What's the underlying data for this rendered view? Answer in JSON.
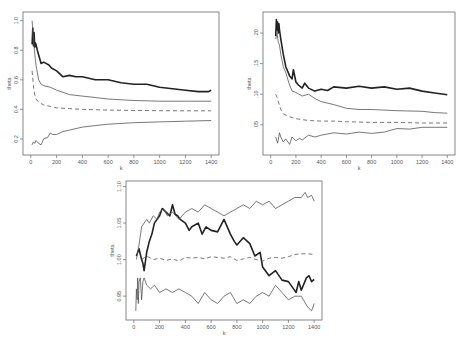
{
  "chart_data": [
    {
      "type": "line",
      "panel": "top-left",
      "title": "",
      "xlabel": "k",
      "ylabel": "theta",
      "xlim": [
        0,
        1400
      ],
      "ylim": [
        0.13,
        1.02
      ],
      "xticks": [
        0,
        200,
        400,
        600,
        800,
        1000,
        1200,
        1400
      ],
      "yticks": [
        0.2,
        0.4,
        0.6,
        0.8,
        1.0
      ],
      "ytick_labels": [
        "0.2",
        "0.4",
        "0.6",
        "0.8",
        "1.0"
      ],
      "grid": false,
      "legend": null,
      "series": [
        {
          "name": "upper",
          "style": "thick",
          "x": [
            10,
            15,
            20,
            25,
            30,
            35,
            40,
            50,
            60,
            80,
            100,
            140,
            160,
            200,
            250,
            300,
            350,
            400,
            500,
            600,
            700,
            800,
            900,
            1000,
            1100,
            1200,
            1300,
            1380,
            1400
          ],
          "y": [
            0.84,
            0.95,
            0.83,
            0.92,
            0.82,
            0.85,
            0.84,
            0.8,
            0.77,
            0.71,
            0.72,
            0.7,
            0.68,
            0.66,
            0.62,
            0.63,
            0.62,
            0.62,
            0.6,
            0.6,
            0.58,
            0.57,
            0.57,
            0.55,
            0.54,
            0.53,
            0.52,
            0.52,
            0.53
          ]
        },
        {
          "name": "middle",
          "style": "thin",
          "x": [
            10,
            20,
            30,
            40,
            60,
            80,
            100,
            150,
            200,
            300,
            400,
            500,
            600,
            800,
            1000,
            1200,
            1400
          ],
          "y": [
            1.0,
            0.88,
            0.78,
            0.7,
            0.6,
            0.57,
            0.56,
            0.55,
            0.53,
            0.5,
            0.49,
            0.48,
            0.47,
            0.46,
            0.455,
            0.455,
            0.455
          ]
        },
        {
          "name": "mean",
          "style": "dashed",
          "x": [
            10,
            20,
            30,
            40,
            60,
            80,
            100,
            150,
            200,
            300,
            400,
            600,
            800,
            1000,
            1200,
            1400
          ],
          "y": [
            0.66,
            0.56,
            0.5,
            0.47,
            0.45,
            0.44,
            0.43,
            0.42,
            0.41,
            0.405,
            0.4,
            0.395,
            0.393,
            0.391,
            0.39,
            0.39
          ]
        },
        {
          "name": "lower",
          "style": "thin",
          "x": [
            10,
            20,
            30,
            40,
            60,
            80,
            100,
            130,
            150,
            170,
            200,
            250,
            300,
            400,
            500,
            600,
            800,
            1000,
            1200,
            1400
          ],
          "y": [
            0.16,
            0.18,
            0.17,
            0.19,
            0.17,
            0.16,
            0.2,
            0.21,
            0.24,
            0.23,
            0.23,
            0.25,
            0.26,
            0.28,
            0.29,
            0.3,
            0.31,
            0.315,
            0.32,
            0.325
          ]
        }
      ]
    },
    {
      "type": "line",
      "panel": "top-right",
      "title": "",
      "xlabel": "k",
      "ylabel": "theta",
      "xlim": [
        0,
        1400
      ],
      "ylim": [
        0.01,
        0.225
      ],
      "xticks": [
        0,
        200,
        400,
        600,
        800,
        1000,
        1200,
        1400
      ],
      "yticks": [
        0.05,
        0.1,
        0.15,
        0.2
      ],
      "ytick_labels": [
        ".05",
        ".10",
        ".15",
        ".20"
      ],
      "grid": false,
      "legend": null,
      "series": [
        {
          "name": "upper",
          "style": "thick",
          "x": [
            40,
            45,
            50,
            55,
            60,
            65,
            70,
            80,
            100,
            120,
            150,
            170,
            180,
            200,
            220,
            250,
            270,
            300,
            350,
            400,
            450,
            500,
            600,
            700,
            800,
            900,
            1000,
            1100,
            1200,
            1300,
            1400
          ],
          "y": [
            0.195,
            0.222,
            0.205,
            0.218,
            0.2,
            0.215,
            0.205,
            0.19,
            0.165,
            0.145,
            0.13,
            0.125,
            0.14,
            0.12,
            0.115,
            0.11,
            0.118,
            0.11,
            0.105,
            0.108,
            0.106,
            0.112,
            0.11,
            0.113,
            0.11,
            0.112,
            0.108,
            0.11,
            0.105,
            0.102,
            0.099
          ]
        },
        {
          "name": "middle",
          "style": "thin",
          "x": [
            40,
            50,
            60,
            70,
            80,
            100,
            120,
            150,
            170,
            200,
            250,
            300,
            350,
            400,
            500,
            600,
            700,
            800,
            1000,
            1200,
            1300,
            1400
          ],
          "y": [
            0.19,
            0.2,
            0.185,
            0.18,
            0.165,
            0.145,
            0.135,
            0.115,
            0.105,
            0.103,
            0.097,
            0.1,
            0.093,
            0.088,
            0.083,
            0.077,
            0.075,
            0.075,
            0.073,
            0.072,
            0.07,
            0.069
          ]
        },
        {
          "name": "mean",
          "style": "dashed",
          "x": [
            40,
            50,
            60,
            80,
            100,
            150,
            200,
            300,
            400,
            500,
            600,
            800,
            1000,
            1200,
            1400
          ],
          "y": [
            0.1,
            0.095,
            0.088,
            0.075,
            0.068,
            0.063,
            0.06,
            0.057,
            0.056,
            0.056,
            0.055,
            0.054,
            0.054,
            0.053,
            0.053
          ]
        },
        {
          "name": "lower",
          "style": "thin",
          "x": [
            40,
            55,
            70,
            80,
            100,
            120,
            150,
            170,
            200,
            230,
            250,
            300,
            350,
            400,
            500,
            600,
            700,
            800,
            900,
            1000,
            1100,
            1200,
            1300,
            1400
          ],
          "y": [
            0.03,
            0.02,
            0.037,
            0.03,
            0.022,
            0.027,
            0.018,
            0.03,
            0.024,
            0.028,
            0.025,
            0.033,
            0.03,
            0.033,
            0.037,
            0.035,
            0.038,
            0.036,
            0.038,
            0.044,
            0.043,
            0.046,
            0.046,
            0.046
          ]
        }
      ]
    },
    {
      "type": "line",
      "panel": "bottom-center",
      "title": "",
      "xlabel": "k",
      "ylabel": "theta",
      "xlim": [
        0,
        1400
      ],
      "ylim": [
        0.925,
        1.1
      ],
      "xticks": [
        0,
        200,
        400,
        600,
        800,
        1000,
        1200,
        1400
      ],
      "yticks": [
        0.95,
        1.0,
        1.05,
        1.1
      ],
      "ytick_labels": [
        "0.95",
        "1.00",
        "1.05",
        "1.10"
      ],
      "grid": false,
      "legend": null,
      "series": [
        {
          "name": "thick",
          "style": "thick",
          "x": [
            20,
            40,
            60,
            70,
            80,
            100,
            120,
            140,
            160,
            200,
            220,
            250,
            280,
            300,
            320,
            340,
            360,
            400,
            430,
            450,
            500,
            530,
            560,
            600,
            650,
            700,
            750,
            780,
            800,
            850,
            900,
            940,
            980,
            1000,
            1050,
            1100,
            1150,
            1200,
            1240,
            1260,
            1280,
            1300,
            1340,
            1360,
            1380,
            1400
          ],
          "y": [
            1.005,
            1.015,
            1.0,
            0.995,
            0.985,
            1.01,
            1.025,
            1.035,
            1.05,
            1.06,
            1.07,
            1.065,
            1.06,
            1.075,
            1.062,
            1.06,
            1.055,
            1.05,
            1.04,
            1.045,
            1.05,
            1.035,
            1.045,
            1.04,
            1.038,
            1.055,
            1.035,
            1.025,
            1.02,
            1.03,
            1.022,
            1.005,
            1.01,
            0.99,
            0.978,
            0.985,
            0.972,
            0.97,
            0.96,
            0.955,
            0.97,
            0.958,
            0.975,
            0.978,
            0.97,
            0.973
          ]
        },
        {
          "name": "upper",
          "style": "thin",
          "x": [
            20,
            40,
            60,
            80,
            100,
            120,
            150,
            180,
            200,
            230,
            260,
            300,
            350,
            400,
            450,
            500,
            550,
            600,
            650,
            700,
            750,
            800,
            850,
            900,
            950,
            1000,
            1050,
            1100,
            1150,
            1200,
            1250,
            1300,
            1330,
            1350,
            1380,
            1400
          ],
          "y": [
            1.0,
            1.02,
            1.045,
            1.05,
            1.055,
            1.05,
            1.06,
            1.055,
            1.065,
            1.07,
            1.06,
            1.065,
            1.055,
            1.065,
            1.07,
            1.065,
            1.075,
            1.07,
            1.065,
            1.06,
            1.065,
            1.07,
            1.075,
            1.07,
            1.08,
            1.075,
            1.08,
            1.07,
            1.075,
            1.08,
            1.085,
            1.085,
            1.092,
            1.085,
            1.088,
            1.08
          ]
        },
        {
          "name": "mean",
          "style": "dashed",
          "x": [
            60,
            100,
            150,
            200,
            250,
            300,
            350,
            400,
            450,
            500,
            550,
            600,
            650,
            700,
            750,
            800,
            850,
            900,
            950,
            1000,
            1050,
            1100,
            1150,
            1200,
            1250,
            1300,
            1350,
            1400
          ],
          "y": [
            1.0,
            1.005,
            1.0,
            1.002,
            0.999,
            1.001,
            0.998,
            1.003,
            1.002,
            1.003,
            1.001,
            1.004,
            1.003,
            1.002,
            1.004,
            0.999,
            1.001,
            1.003,
            1.0,
            0.998,
            1.002,
            1.003,
            1.002,
            1.004,
            1.007,
            1.008,
            1.008,
            1.007
          ]
        },
        {
          "name": "lower",
          "style": "thin",
          "x": [
            15,
            20,
            25,
            30,
            35,
            40,
            50,
            60,
            70,
            80,
            100,
            130,
            160,
            200,
            250,
            300,
            350,
            400,
            450,
            500,
            550,
            600,
            650,
            700,
            750,
            800,
            850,
            900,
            950,
            1000,
            1050,
            1100,
            1150,
            1200,
            1250,
            1300,
            1350,
            1380,
            1400
          ],
          "y": [
            0.93,
            0.96,
            0.945,
            0.975,
            0.94,
            0.97,
            0.975,
            0.945,
            0.97,
            0.975,
            0.965,
            0.96,
            0.965,
            0.955,
            0.96,
            0.955,
            0.96,
            0.955,
            0.95,
            0.94,
            0.955,
            0.945,
            0.94,
            0.95,
            0.955,
            0.94,
            0.945,
            0.94,
            0.95,
            0.955,
            0.95,
            0.965,
            0.955,
            0.945,
            0.95,
            0.95,
            0.935,
            0.93,
            0.94
          ]
        }
      ]
    }
  ],
  "panels": [
    {
      "id": "p1",
      "frame": {
        "left": 23,
        "top": 12,
        "right": 219,
        "bottom": 155
      }
    },
    {
      "id": "p2",
      "frame": {
        "left": 263,
        "top": 12,
        "right": 455,
        "bottom": 155
      }
    },
    {
      "id": "p3",
      "frame": {
        "left": 126,
        "top": 181,
        "right": 322,
        "bottom": 320
      }
    }
  ]
}
